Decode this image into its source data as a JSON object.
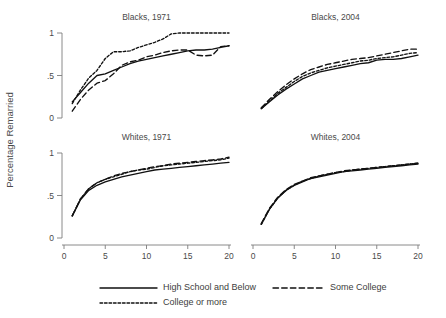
{
  "figure": {
    "ylabel": "Percentage Remarried",
    "legend": [
      {
        "label": "High School and Below",
        "style": "solid"
      },
      {
        "label": "Some College",
        "style": "dashed"
      },
      {
        "label": "College or more",
        "style": "dotted"
      }
    ]
  },
  "chart_data": {
    "type": "line",
    "title": "",
    "xlabel": "",
    "ylabel": "Percentage Remarried",
    "xlim": [
      0,
      20
    ],
    "ylim": [
      0,
      1
    ],
    "xticks": [
      0,
      5,
      10,
      15,
      20
    ],
    "xticklabels": [
      "0",
      "5",
      "10",
      "15",
      "20"
    ],
    "yticks": [
      0,
      0.5,
      1
    ],
    "yticklabels": [
      "0",
      ".5",
      "1"
    ],
    "grid": false,
    "legend_position": "bottom",
    "panel_layout": [
      2,
      2
    ],
    "panels": [
      {
        "title": "Blacks, 1971",
        "row": 0,
        "col": 0,
        "series": [
          {
            "name": "High School and Below",
            "style": "solid",
            "x": [
              1,
              2,
              3,
              4,
              5,
              6,
              7,
              8,
              9,
              10,
              11,
              12,
              13,
              14,
              15,
              16,
              17,
              18,
              19,
              20
            ],
            "values": [
              0.19,
              0.3,
              0.41,
              0.5,
              0.52,
              0.56,
              0.6,
              0.64,
              0.67,
              0.69,
              0.71,
              0.73,
              0.75,
              0.77,
              0.79,
              0.8,
              0.8,
              0.81,
              0.83,
              0.85
            ]
          },
          {
            "name": "Some College",
            "style": "dashed",
            "x": [
              1,
              2,
              3,
              4,
              5,
              6,
              7,
              8,
              9,
              10,
              11,
              12,
              13,
              14,
              15,
              16,
              17,
              18,
              19,
              20
            ],
            "values": [
              0.08,
              0.22,
              0.33,
              0.41,
              0.44,
              0.52,
              0.62,
              0.66,
              0.68,
              0.72,
              0.74,
              0.77,
              0.79,
              0.8,
              0.8,
              0.74,
              0.73,
              0.74,
              0.84,
              0.85
            ]
          },
          {
            "name": "College or more",
            "style": "dotted",
            "x": [
              1,
              2,
              3,
              4,
              5,
              6,
              7,
              8,
              9,
              10,
              11,
              12,
              13,
              14,
              15,
              16,
              17,
              18,
              19,
              20
            ],
            "values": [
              0.17,
              0.33,
              0.47,
              0.56,
              0.7,
              0.78,
              0.78,
              0.79,
              0.83,
              0.86,
              0.89,
              0.93,
              0.99,
              1.0,
              1.0,
              1.0,
              1.0,
              1.0,
              1.0,
              1.0
            ]
          }
        ]
      },
      {
        "title": "Blacks, 2004",
        "row": 0,
        "col": 1,
        "series": [
          {
            "name": "High School and Below",
            "style": "solid",
            "x": [
              1,
              2,
              3,
              4,
              5,
              6,
              7,
              8,
              9,
              10,
              11,
              12,
              13,
              14,
              15,
              16,
              17,
              18,
              19,
              20
            ],
            "values": [
              0.11,
              0.19,
              0.27,
              0.34,
              0.4,
              0.46,
              0.5,
              0.54,
              0.56,
              0.58,
              0.6,
              0.62,
              0.64,
              0.65,
              0.68,
              0.69,
              0.69,
              0.7,
              0.72,
              0.74
            ]
          },
          {
            "name": "Some College",
            "style": "dashed",
            "x": [
              1,
              2,
              3,
              4,
              5,
              6,
              7,
              8,
              9,
              10,
              11,
              12,
              13,
              14,
              15,
              16,
              17,
              18,
              19,
              20
            ],
            "values": [
              0.12,
              0.22,
              0.31,
              0.39,
              0.46,
              0.52,
              0.57,
              0.6,
              0.63,
              0.65,
              0.67,
              0.69,
              0.7,
              0.71,
              0.73,
              0.75,
              0.77,
              0.79,
              0.81,
              0.81
            ]
          },
          {
            "name": "College or more",
            "style": "dotted",
            "x": [
              1,
              2,
              3,
              4,
              5,
              6,
              7,
              8,
              9,
              10,
              11,
              12,
              13,
              14,
              15,
              16,
              17,
              18,
              19,
              20
            ],
            "values": [
              0.11,
              0.2,
              0.29,
              0.36,
              0.43,
              0.49,
              0.53,
              0.56,
              0.59,
              0.61,
              0.63,
              0.65,
              0.67,
              0.68,
              0.7,
              0.71,
              0.72,
              0.74,
              0.76,
              0.77
            ]
          }
        ]
      },
      {
        "title": "Whites, 1971",
        "row": 1,
        "col": 0,
        "series": [
          {
            "name": "High School and Below",
            "style": "solid",
            "x": [
              1,
              2,
              3,
              4,
              5,
              6,
              7,
              8,
              9,
              10,
              11,
              12,
              13,
              14,
              15,
              16,
              17,
              18,
              19,
              20
            ],
            "values": [
              0.26,
              0.45,
              0.56,
              0.62,
              0.66,
              0.69,
              0.72,
              0.74,
              0.76,
              0.78,
              0.8,
              0.81,
              0.82,
              0.83,
              0.84,
              0.85,
              0.86,
              0.87,
              0.88,
              0.89
            ]
          },
          {
            "name": "Some College",
            "style": "dashed",
            "x": [
              1,
              2,
              3,
              4,
              5,
              6,
              7,
              8,
              9,
              10,
              11,
              12,
              13,
              14,
              15,
              16,
              17,
              18,
              19,
              20
            ],
            "values": [
              0.26,
              0.46,
              0.58,
              0.65,
              0.69,
              0.73,
              0.76,
              0.78,
              0.8,
              0.82,
              0.84,
              0.85,
              0.87,
              0.88,
              0.89,
              0.9,
              0.91,
              0.92,
              0.93,
              0.95
            ]
          },
          {
            "name": "College or more",
            "style": "dotted",
            "x": [
              1,
              2,
              3,
              4,
              5,
              6,
              7,
              8,
              9,
              10,
              11,
              12,
              13,
              14,
              15,
              16,
              17,
              18,
              19,
              20
            ],
            "values": [
              0.26,
              0.46,
              0.58,
              0.65,
              0.69,
              0.72,
              0.75,
              0.78,
              0.8,
              0.81,
              0.83,
              0.85,
              0.86,
              0.87,
              0.88,
              0.89,
              0.9,
              0.91,
              0.92,
              0.94
            ]
          }
        ]
      },
      {
        "title": "Whites, 2004",
        "row": 1,
        "col": 1,
        "series": [
          {
            "name": "High School and Below",
            "style": "solid",
            "x": [
              1,
              2,
              3,
              4,
              5,
              6,
              7,
              8,
              9,
              10,
              11,
              12,
              13,
              14,
              15,
              16,
              17,
              18,
              19,
              20
            ],
            "values": [
              0.16,
              0.34,
              0.47,
              0.56,
              0.62,
              0.66,
              0.7,
              0.72,
              0.74,
              0.76,
              0.78,
              0.79,
              0.8,
              0.81,
              0.82,
              0.83,
              0.84,
              0.85,
              0.86,
              0.87
            ]
          },
          {
            "name": "Some College",
            "style": "dashed",
            "x": [
              1,
              2,
              3,
              4,
              5,
              6,
              7,
              8,
              9,
              10,
              11,
              12,
              13,
              14,
              15,
              16,
              17,
              18,
              19,
              20
            ],
            "values": [
              0.17,
              0.35,
              0.48,
              0.57,
              0.63,
              0.67,
              0.71,
              0.73,
              0.75,
              0.77,
              0.79,
              0.8,
              0.81,
              0.82,
              0.83,
              0.84,
              0.85,
              0.86,
              0.87,
              0.88
            ]
          },
          {
            "name": "College or more",
            "style": "dotted",
            "x": [
              1,
              2,
              3,
              4,
              5,
              6,
              7,
              8,
              9,
              10,
              11,
              12,
              13,
              14,
              15,
              16,
              17,
              18,
              19,
              20
            ],
            "values": [
              0.16,
              0.34,
              0.47,
              0.56,
              0.62,
              0.67,
              0.7,
              0.73,
              0.75,
              0.77,
              0.78,
              0.8,
              0.81,
              0.82,
              0.83,
              0.84,
              0.85,
              0.86,
              0.87,
              0.88
            ]
          }
        ]
      }
    ]
  }
}
